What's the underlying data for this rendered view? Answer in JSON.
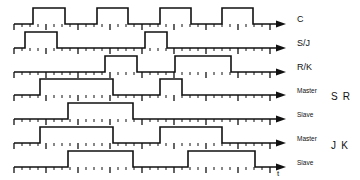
{
  "figure": {
    "background_color": "#ffffff",
    "trace_color": "#111111",
    "axis_label": "t",
    "time_axis_note": "t"
  },
  "axis": {
    "x_start": 14,
    "x_arrow_end": 286,
    "tick_spacing": 8,
    "major_tick_every": 4,
    "tick_minor_height": 3,
    "tick_major_height": 6,
    "tick_count": 34
  },
  "group_labels": [
    {
      "text": "S R",
      "rows": [
        "Master",
        "Slave"
      ],
      "y": 97
    },
    {
      "text": "J K",
      "rows": [
        "Master",
        "Slave"
      ],
      "y": 146
    }
  ],
  "rows": [
    {
      "label": "C",
      "label_size": "normal",
      "baseline_y": 24,
      "high_y": 8,
      "pulses": [
        {
          "start": 33,
          "end": 65
        },
        {
          "start": 97,
          "end": 128
        },
        {
          "start": 160,
          "end": 191
        },
        {
          "start": 222,
          "end": 253
        }
      ]
    },
    {
      "label": "S/J",
      "label_size": "normal",
      "baseline_y": 48,
      "high_y": 32,
      "pulses": [
        {
          "start": 25,
          "end": 57
        },
        {
          "start": 145,
          "end": 167
        }
      ]
    },
    {
      "label": "R/K",
      "label_size": "normal",
      "baseline_y": 72,
      "high_y": 56,
      "pulses": [
        {
          "start": 105,
          "end": 137
        },
        {
          "start": 175,
          "end": 231
        }
      ]
    },
    {
      "label": "Master",
      "label_size": "small",
      "baseline_y": 95,
      "high_y": 79,
      "pulses": [
        {
          "start": 40,
          "end": 113
        },
        {
          "start": 160,
          "end": 182
        }
      ]
    },
    {
      "label": "Slave",
      "label_size": "small",
      "baseline_y": 119,
      "high_y": 103,
      "pulses": [
        {
          "start": 68,
          "end": 133
        }
      ]
    },
    {
      "label": "Master",
      "label_size": "small",
      "baseline_y": 143,
      "high_y": 127,
      "pulses": [
        {
          "start": 40,
          "end": 113
        },
        {
          "start": 160,
          "end": 222
        }
      ]
    },
    {
      "label": "Slave",
      "label_size": "small",
      "baseline_y": 167,
      "high_y": 151,
      "pulses": [
        {
          "start": 68,
          "end": 133
        },
        {
          "start": 188,
          "end": 255
        }
      ]
    }
  ],
  "chart_data": {
    "type": "line",
    "xlabel": "t",
    "ylabel": "",
    "grid": false,
    "legend": "right-side signal names",
    "x_unit": "clock tick",
    "series": [
      {
        "name": "C",
        "description": "Clock signal, four square pulses",
        "high_intervals": [
          [
            33,
            65
          ],
          [
            97,
            128
          ],
          [
            160,
            191
          ],
          [
            222,
            253
          ]
        ]
      },
      {
        "name": "S/J",
        "description": "Set / J input",
        "high_intervals": [
          [
            25,
            57
          ],
          [
            145,
            167
          ]
        ]
      },
      {
        "name": "R/K",
        "description": "Reset / K input",
        "high_intervals": [
          [
            105,
            137
          ],
          [
            175,
            231
          ]
        ]
      },
      {
        "name": "Master",
        "group": "S R",
        "description": "SR master latch output",
        "high_intervals": [
          [
            40,
            113
          ],
          [
            160,
            182
          ]
        ]
      },
      {
        "name": "Slave",
        "group": "S R",
        "description": "SR slave latch output",
        "high_intervals": [
          [
            68,
            133
          ]
        ]
      },
      {
        "name": "Master",
        "group": "J K",
        "description": "JK master latch output",
        "high_intervals": [
          [
            40,
            113
          ],
          [
            160,
            222
          ]
        ]
      },
      {
        "name": "Slave",
        "group": "J K",
        "description": "JK slave latch output",
        "high_intervals": [
          [
            68,
            133
          ],
          [
            188,
            255
          ]
        ]
      }
    ]
  }
}
